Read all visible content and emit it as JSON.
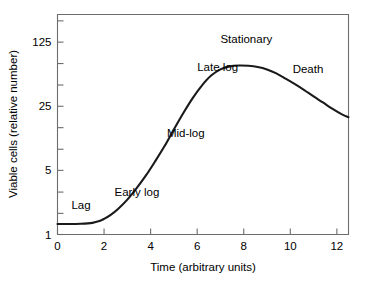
{
  "chart_data": {
    "type": "line",
    "title": "",
    "xlabel": "Time (arbitrary units)",
    "ylabel": "Viable cells (relative number)",
    "xlim": [
      0,
      12.5
    ],
    "ylim": [
      1,
      250
    ],
    "yscale": "log",
    "grid": false,
    "legend": null,
    "x_ticks": [
      {
        "value": 0,
        "label": "0"
      },
      {
        "value": 2,
        "label": "2"
      },
      {
        "value": 4,
        "label": "4"
      },
      {
        "value": 6,
        "label": "6"
      },
      {
        "value": 8,
        "label": "8"
      },
      {
        "value": 10,
        "label": "10"
      },
      {
        "value": 12,
        "label": "12"
      }
    ],
    "y_ticks": [
      {
        "value": 1,
        "label": "1"
      },
      {
        "value": 5,
        "label": "5"
      },
      {
        "value": 25,
        "label": "25"
      },
      {
        "value": 125,
        "label": "125"
      }
    ],
    "y_minor_ticks": [
      1.7,
      2.9,
      8.5,
      14.6,
      42.6,
      73.0,
      213.0
    ],
    "series": [
      {
        "name": "Viable cells",
        "x": [
          0.0,
          0.5,
          1.0,
          1.5,
          1.8,
          2.0,
          2.3,
          2.6,
          3.0,
          3.4,
          3.8,
          4.2,
          4.6,
          5.0,
          5.4,
          5.8,
          6.2,
          6.6,
          7.0,
          7.4,
          7.8,
          8.2,
          8.6,
          9.0,
          9.4,
          9.8,
          10.2,
          10.6,
          11.0,
          11.4,
          11.8,
          12.2,
          12.5
        ],
        "values": [
          1.3,
          1.3,
          1.31,
          1.34,
          1.4,
          1.48,
          1.65,
          1.9,
          2.4,
          3.2,
          4.4,
          6.3,
          9.2,
          14.0,
          21.0,
          30.5,
          42.0,
          54.0,
          63.0,
          68.0,
          69.5,
          69.0,
          67.0,
          63.0,
          57.0,
          50.0,
          43.5,
          37.5,
          32.0,
          27.5,
          23.5,
          20.5,
          19.0
        ]
      }
    ],
    "annotations": [
      {
        "name": "lag",
        "text": "Lag",
        "x": 0.6,
        "y": 1.9
      },
      {
        "name": "early-log",
        "text": "Early log",
        "x": 2.45,
        "y": 2.6
      },
      {
        "name": "mid-log",
        "text": "Mid-log",
        "x": 4.7,
        "y": 11.5
      },
      {
        "name": "late-log",
        "text": "Late log",
        "x": 6.0,
        "y": 60.0
      },
      {
        "name": "stationary",
        "text": "Stationary",
        "x": 7.0,
        "y": 122.0
      },
      {
        "name": "death",
        "text": "Death",
        "x": 10.1,
        "y": 58.0
      }
    ],
    "colors": {
      "curve": "#1a1a1a",
      "axis": "#6d6d6d",
      "text": "#000000",
      "background": "#ffffff"
    }
  }
}
